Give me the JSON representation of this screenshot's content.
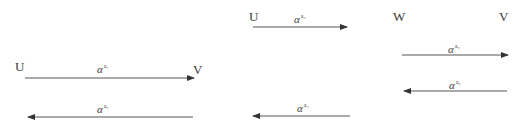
{
  "diagrams": [
    {
      "id": "left",
      "nodes": [
        {
          "label": "U",
          "x": 15,
          "y": 60
        },
        {
          "label": "V",
          "x": 193,
          "y": 63
        }
      ],
      "arrows": [
        {
          "direction": "right",
          "label_base": "α",
          "label_sup": "a₁",
          "x1": 25,
          "x2": 194,
          "y": 78,
          "label_x": 97,
          "label_y": 61
        },
        {
          "direction": "left",
          "label_base": "α",
          "label_sup": "a₂",
          "x1": 28,
          "x2": 193,
          "y": 117,
          "label_x": 97,
          "label_y": 101
        }
      ]
    },
    {
      "id": "middle",
      "nodes": [
        {
          "label": "U",
          "x": 249,
          "y": 10
        }
      ],
      "arrows": [
        {
          "direction": "right",
          "label_base": "α",
          "label_sup": "a₃",
          "x1": 253,
          "x2": 347,
          "y": 27,
          "label_x": 294,
          "label_y": 11
        },
        {
          "direction": "left",
          "label_base": "α",
          "label_sup": "a₄",
          "x1": 253,
          "x2": 350,
          "y": 116,
          "label_x": 297,
          "label_y": 100
        }
      ]
    },
    {
      "id": "right",
      "nodes": [
        {
          "label": "W",
          "x": 393,
          "y": 10
        },
        {
          "label": "V",
          "x": 499,
          "y": 10
        }
      ],
      "arrows": [
        {
          "direction": "right",
          "label_base": "α",
          "label_sup": "a₅",
          "x1": 402,
          "x2": 508,
          "y": 55,
          "label_x": 448,
          "label_y": 41
        },
        {
          "direction": "left",
          "label_base": "α",
          "label_sup": "a₆",
          "x1": 404,
          "x2": 507,
          "y": 91,
          "label_x": 449,
          "label_y": 77
        }
      ]
    }
  ],
  "colors": {
    "line": "#555555",
    "text": "#3a3a3a",
    "background": "#ffffff"
  }
}
